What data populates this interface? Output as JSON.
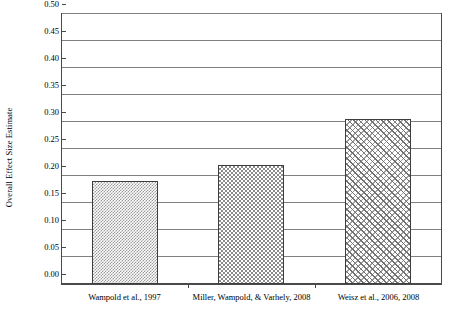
{
  "chart_data": {
    "type": "bar",
    "title": "",
    "subtitle": "",
    "xlabel": "",
    "ylabel": "Overall Effect Size Estimate",
    "categories": [
      "Wampold et al., 1997",
      "Miller, Wampold, & Varhely, 2008",
      "Weisz et al., 2006, 2008"
    ],
    "values": [
      0.19,
      0.22,
      0.305
    ],
    "ylim": [
      0.0,
      0.5
    ],
    "ytick_step": 0.05,
    "ytick_labels": [
      "0.00",
      "0.05",
      "0.10",
      "0.15",
      "0.20",
      "0.25",
      "0.30",
      "0.35",
      "0.40",
      "0.45",
      "0.50"
    ],
    "ytick_values": [
      0.0,
      0.05,
      0.1,
      0.15,
      0.2,
      0.25,
      0.3,
      0.35,
      0.4,
      0.45,
      0.5
    ],
    "grid": true,
    "grid_axis": "y",
    "legend": false,
    "legend_position": "none",
    "bar_patterns": [
      "checker-fine",
      "checker-medium",
      "diagonal-hatch"
    ],
    "colors": {
      "background": "#ffffff",
      "axis": "#4a4a4a",
      "gridline": "#808080",
      "bar_outline": "#3d3d3d",
      "bar_fill_light": "#9a9a9a",
      "bar_fill_medium": "#8c8c8c",
      "bar_fill_hatch": "#6f6f6f",
      "text": "#000000"
    }
  }
}
